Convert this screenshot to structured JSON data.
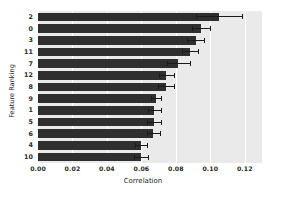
{
  "chart_data": {
    "type": "bar",
    "orientation": "horizontal",
    "title": "",
    "xlabel": "Correlation",
    "ylabel": "Feature Ranking",
    "xlim": [
      0.0,
      0.13
    ],
    "ylim": [
      0,
      13
    ],
    "grid": true,
    "legend": null,
    "xticks": [
      "0.00",
      "0.02",
      "0.04",
      "0.06",
      "0.08",
      "0.10",
      "0.12"
    ],
    "xtick_values": [
      0.0,
      0.02,
      0.04,
      0.06,
      0.08,
      0.1,
      0.12
    ],
    "categories": [
      "2",
      "0",
      "3",
      "11",
      "7",
      "12",
      "8",
      "9",
      "1",
      "5",
      "6",
      "4",
      "10"
    ],
    "values": [
      0.105,
      0.0947,
      0.0915,
      0.0884,
      0.0815,
      0.0745,
      0.0744,
      0.0686,
      0.0675,
      0.0672,
      0.067,
      0.06,
      0.0598
    ],
    "errors": [
      0.0135,
      0.0052,
      0.0048,
      0.0046,
      0.0068,
      0.0045,
      0.0046,
      0.003,
      0.0039,
      0.004,
      0.0038,
      0.0035,
      0.0038
    ],
    "bar_color": "#2f2f2f",
    "error_color": "#1a1a1a",
    "axes_facecolor": "#eaeaea",
    "grid_color": "#ffffff",
    "figure_facecolor": "#ffffff"
  }
}
